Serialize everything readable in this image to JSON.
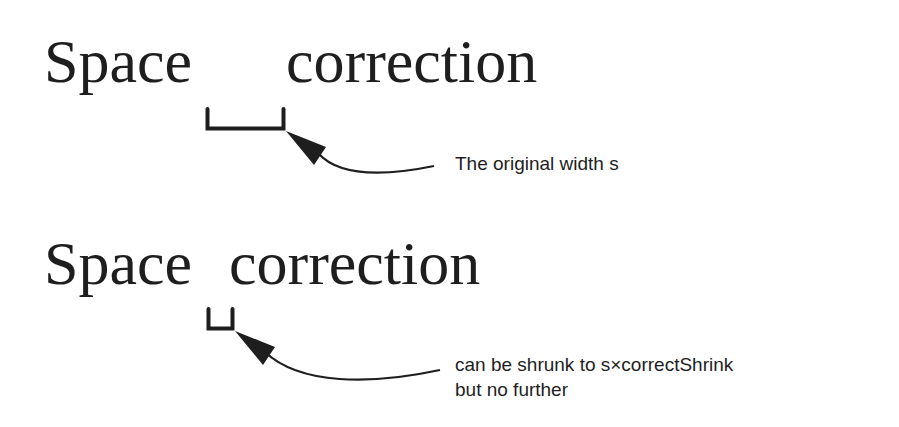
{
  "example_1": {
    "word_1": "Space",
    "word_2": "correction",
    "caption": "The original width s"
  },
  "example_2": {
    "word_1": "Space",
    "word_2": "correction",
    "caption_line_1": "can be shrunk to s×correctShrink",
    "caption_line_2": "but no further"
  },
  "colors": {
    "ink": "#1e1e1e",
    "background": "#ffffff"
  }
}
